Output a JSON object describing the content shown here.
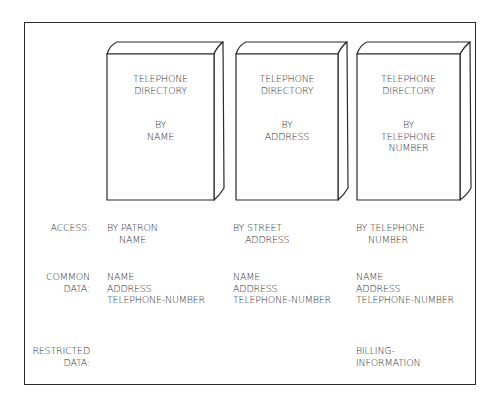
{
  "diagram": {
    "books": [
      {
        "title": [
          "TELEPHONE",
          "DIRECTORY"
        ],
        "subtitle": [
          "BY",
          "NAME"
        ]
      },
      {
        "title": [
          "TELEPHONE",
          "DIRECTORY"
        ],
        "subtitle": [
          "BY",
          "ADDRESS"
        ]
      },
      {
        "title": [
          "TELEPHONE",
          "DIRECTORY"
        ],
        "subtitle": [
          "BY",
          "TELEPHONE",
          "NUMBER"
        ]
      }
    ],
    "row_labels": {
      "access": "ACCESS:",
      "common_1": "COMMON",
      "common_2": "DATA:",
      "restricted_1": "RESTRICTED",
      "restricted_2": "DATA:"
    },
    "columns": [
      {
        "access": [
          "BY PATRON",
          "NAME"
        ],
        "common_data": [
          "NAME",
          "ADDRESS",
          "TELEPHONE-NUMBER"
        ],
        "restricted_data": []
      },
      {
        "access": [
          "BY STREET",
          "ADDRESS"
        ],
        "common_data": [
          "NAME",
          "ADDRESS",
          "TELEPHONE-NUMBER"
        ],
        "restricted_data": []
      },
      {
        "access": [
          "BY TELEPHONE",
          "NUMBER"
        ],
        "common_data": [
          "NAME",
          "ADDRESS",
          "TELEPHONE-NUMBER"
        ],
        "restricted_data": [
          "BILLING-",
          "INFORMATION"
        ]
      }
    ]
  }
}
